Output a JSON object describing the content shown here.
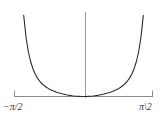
{
  "figure": {
    "background_color": "#ffffff",
    "width": 167,
    "height": 117
  },
  "axes": {
    "x_axis_color": "#8c8c8c",
    "y_axis_color": "#9a9a9a",
    "curve_color": "#2b2b2b",
    "tick_color": "#8c8c8c",
    "label_color": "#3a3a3a"
  },
  "labels": {
    "x_min_label": "−π/2",
    "x_max_label": "π\\2"
  },
  "chart_data": {
    "type": "line",
    "title": "",
    "xlabel": "",
    "ylabel": "",
    "grid": false,
    "legend": false,
    "xlim": [
      -1.5707963,
      1.5707963
    ],
    "ylim": [
      0,
      12
    ],
    "xticks": [
      -1.5707963,
      1.5707963
    ],
    "xticklabels": [
      "−π/2",
      "π\\2"
    ],
    "yticks": [],
    "yticklabels": [],
    "series": [
      {
        "name": "curve",
        "x": [
          -1.3614,
          -1.309,
          -1.2566,
          -1.2043,
          -1.1519,
          -1.0996,
          -1.0472,
          -0.9948,
          -0.9425,
          -0.8901,
          -0.8378,
          -0.7854,
          -0.733,
          -0.6807,
          -0.6283,
          -0.576,
          -0.5236,
          -0.4712,
          -0.4189,
          -0.3665,
          -0.3142,
          -0.2618,
          -0.2094,
          -0.1571,
          -0.1047,
          -0.0524,
          0.0,
          0.0524,
          0.1047,
          0.1571,
          0.2094,
          0.2618,
          0.3142,
          0.3665,
          0.4189,
          0.4712,
          0.5236,
          0.576,
          0.6283,
          0.6807,
          0.733,
          0.7854,
          0.8378,
          0.8901,
          0.9425,
          0.9948,
          1.0472,
          1.0996,
          1.1519,
          1.2043,
          1.2566,
          1.309,
          1.3614
        ],
        "y": [
          11.52,
          8.45,
          6.39,
          4.97,
          3.95,
          3.19,
          2.61,
          2.16,
          1.81,
          1.52,
          1.28,
          1.08,
          0.92,
          0.77,
          0.65,
          0.54,
          0.45,
          0.36,
          0.29,
          0.22,
          0.16,
          0.11,
          0.07,
          0.04,
          0.02,
          0.0,
          0.0,
          0.0,
          0.02,
          0.04,
          0.07,
          0.11,
          0.16,
          0.22,
          0.29,
          0.36,
          0.45,
          0.54,
          0.65,
          0.77,
          0.92,
          1.08,
          1.28,
          1.52,
          1.81,
          2.16,
          2.61,
          3.19,
          3.95,
          4.97,
          6.39,
          8.45,
          11.52
        ]
      }
    ]
  }
}
